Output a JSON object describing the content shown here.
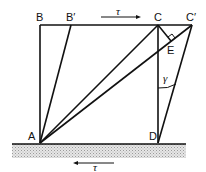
{
  "diagram": {
    "points": {
      "A": {
        "label": "A",
        "x": 40,
        "y": 143
      },
      "B": {
        "label": "B",
        "x": 40,
        "y": 25
      },
      "B_prime": {
        "label": "B′",
        "x": 71,
        "y": 25
      },
      "C": {
        "label": "C",
        "x": 158,
        "y": 25
      },
      "C_prime": {
        "label": "C′",
        "x": 192,
        "y": 25
      },
      "D": {
        "label": "D",
        "x": 158,
        "y": 143
      },
      "E": {
        "label": "E",
        "x": 171,
        "y": 44
      }
    },
    "labels": {
      "top_shear": "τ",
      "bottom_shear": "τ",
      "shear_angle": "γ"
    },
    "colors": {
      "line": "#111111",
      "ground_fill": "#cfcfcf"
    }
  }
}
